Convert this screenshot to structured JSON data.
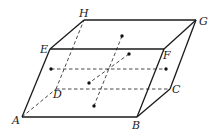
{
  "figure": {
    "vertices": {
      "A": {
        "label": "A",
        "x": 22,
        "y": 117,
        "lx": 12,
        "ly": 124
      },
      "B": {
        "label": "B",
        "x": 137,
        "y": 117,
        "lx": 132,
        "ly": 129
      },
      "C": {
        "label": "C",
        "x": 170,
        "y": 89,
        "lx": 172,
        "ly": 93
      },
      "D": {
        "label": "D",
        "x": 56,
        "y": 89,
        "lx": 53,
        "ly": 98
      },
      "E": {
        "label": "E",
        "x": 50,
        "y": 49,
        "lx": 40,
        "ly": 53
      },
      "F": {
        "label": "F",
        "x": 164,
        "y": 49,
        "lx": 163,
        "ly": 59
      },
      "G": {
        "label": "G",
        "x": 196,
        "y": 20,
        "lx": 199,
        "ly": 25
      },
      "H": {
        "label": "H",
        "x": 84,
        "y": 20,
        "lx": 79,
        "ly": 17
      }
    },
    "face_center_points": [
      {
        "name": "left-face-center",
        "x": 51,
        "y": 69
      },
      {
        "name": "right-face-center",
        "x": 166,
        "y": 69
      },
      {
        "name": "top-face-center",
        "x": 122,
        "y": 36
      },
      {
        "name": "bottom-face-center",
        "x": 94,
        "y": 106
      },
      {
        "name": "back-face-center",
        "x": 129,
        "y": 54
      },
      {
        "name": "front-face-center",
        "x": 89,
        "y": 83
      }
    ],
    "colors": {
      "line": "#1a1a1a",
      "background": "#ffffff"
    }
  }
}
